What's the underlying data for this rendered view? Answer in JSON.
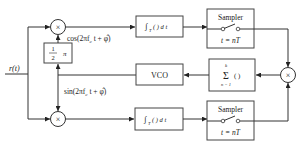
{
  "diagram": {
    "type": "block-diagram",
    "input": {
      "label": "r(t)"
    },
    "multipliers": [
      {
        "id": "mult-top",
        "symbol": "×"
      },
      {
        "id": "mult-bottom",
        "symbol": "×"
      },
      {
        "id": "mult-right",
        "symbol": "×"
      }
    ],
    "blocks": {
      "phase_shift": {
        "num": "1",
        "den": "2",
        "suffix": "π"
      },
      "integrator_top": {
        "label": "∫T( ) dt",
        "int": "∫",
        "sub": "T",
        "body": "( ) d t"
      },
      "integrator_bottom": {
        "label": "∫T( ) dt",
        "int": "∫",
        "sub": "T",
        "body": "( ) d t"
      },
      "sampler_top": {
        "title": "Sampler",
        "caption": "t = nT"
      },
      "sampler_bottom": {
        "title": "Sampler",
        "caption": "t = nT"
      },
      "summer": {
        "sigma": "Σ",
        "upper": "k",
        "lower": "n = 1",
        "body": "( )"
      },
      "vco": {
        "label": "VCO"
      }
    },
    "signals": {
      "cos_ref": "cos(2πf_c t + φ̂)",
      "sin_ref": "sin(2πf_c t + φ̂)"
    },
    "signal_parts": {
      "cos_prefix": "cos(2πf",
      "sin_prefix": "sin(2πf",
      "sub_c": "c",
      "suffix": " t + ",
      "phi": "φ̂",
      "close": ")"
    }
  }
}
